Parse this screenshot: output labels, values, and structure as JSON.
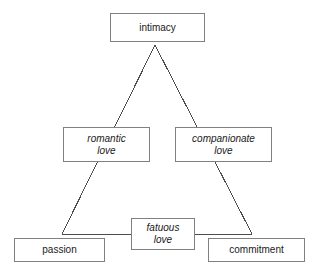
{
  "diagram": {
    "style": {
      "background": "#ffffff",
      "box_border": "#808080",
      "edge_stroke": "#4d4d4d",
      "text": "#1a1a1a"
    },
    "nodes": [
      {
        "id": "intimacy",
        "label": "intimacy",
        "italic": false,
        "position": "apex-top"
      },
      {
        "id": "romantic-love",
        "label": "romantic\nlove",
        "italic": true,
        "position": "mid-left"
      },
      {
        "id": "companionate-love",
        "label": "companionate\nlove",
        "italic": true,
        "position": "mid-right"
      },
      {
        "id": "passion",
        "label": "passion",
        "italic": false,
        "position": "bottom-left"
      },
      {
        "id": "fatuous-love",
        "label": "fatuous\nlove",
        "italic": true,
        "position": "bottom-center"
      },
      {
        "id": "commitment",
        "label": "commitment",
        "italic": false,
        "position": "bottom-right"
      }
    ],
    "edges": [
      {
        "from": "intimacy",
        "to": "passion",
        "via": "romantic-love",
        "kind": "triangle-left-side"
      },
      {
        "from": "intimacy",
        "to": "commitment",
        "via": "companionate-love",
        "kind": "triangle-right-side"
      },
      {
        "from": "passion",
        "to": "commitment",
        "via": "fatuous-love",
        "kind": "triangle-base"
      }
    ],
    "bottom_fragment": "cut-off text"
  }
}
